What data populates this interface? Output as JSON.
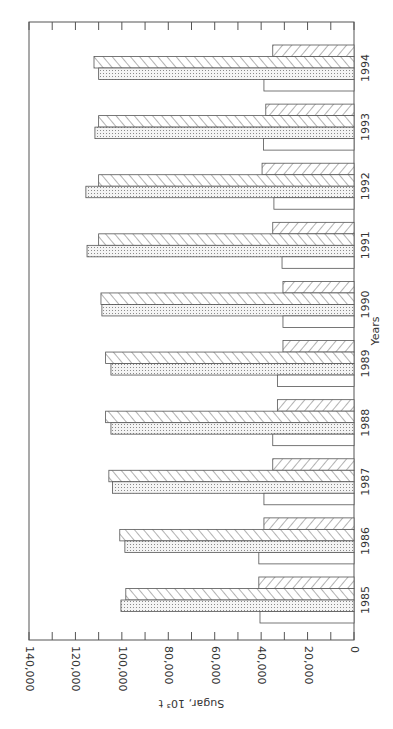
{
  "chart_data": {
    "type": "bar",
    "orientation": "rotated-90",
    "title": "",
    "xlabel": "Years",
    "ylabel": "Sugar, 10³ t",
    "ylim": [
      0,
      140000
    ],
    "y_ticks": [
      "0",
      "20,000",
      "40,000",
      "60,000",
      "80,000",
      "100,000",
      "120,000",
      "140,000"
    ],
    "categories": [
      "1985",
      "1986",
      "1987",
      "1988",
      "1989",
      "1990",
      "1991",
      "1992",
      "1993",
      "1994"
    ],
    "series": [
      {
        "name": "Series A (blank)",
        "pattern": "blank",
        "values": [
          40500,
          41000,
          38800,
          35000,
          33000,
          30600,
          31000,
          34500,
          39000,
          38800
        ]
      },
      {
        "name": "Series B (dotted)",
        "pattern": "dotted",
        "values": [
          100400,
          98700,
          104000,
          104700,
          104700,
          108600,
          115000,
          115500,
          111600,
          110000
        ]
      },
      {
        "name": "Series C (forward hatch)",
        "pattern": "hatch-forward",
        "values": [
          98300,
          100900,
          105600,
          107000,
          107000,
          109000,
          110000,
          110000,
          110000,
          112000
        ]
      },
      {
        "name": "Series D (back hatch)",
        "pattern": "hatch-back",
        "values": [
          41000,
          38800,
          35000,
          33000,
          30600,
          30600,
          35000,
          39600,
          38000,
          35000
        ]
      }
    ],
    "grid": false,
    "legend": "none"
  }
}
